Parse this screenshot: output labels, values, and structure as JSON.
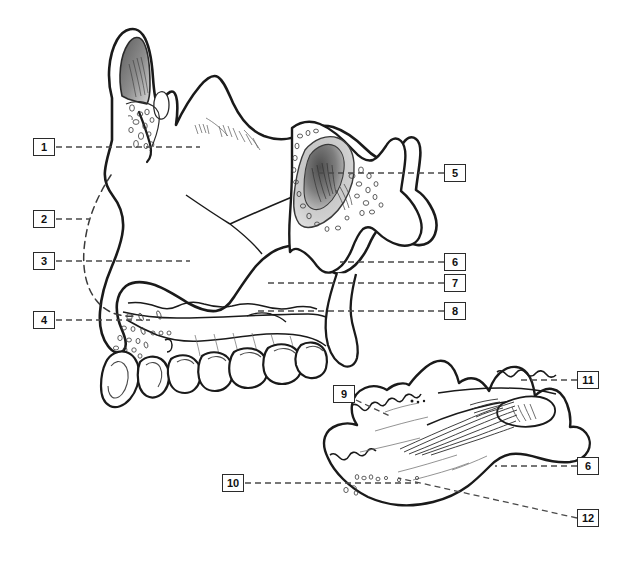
{
  "figure": {
    "type": "anatomical-line-diagram",
    "title_visible": false,
    "background_color": "#ffffff",
    "ink_color": "#1a1a1a",
    "leader_line_color": "#4a4a4a",
    "shading": {
      "frontal_sinus_dark": "#4c4c4c",
      "frontal_sinus_light": "#d6d6d6",
      "sphenoid_sinus_dark": "#5a5a5a",
      "sphenoid_sinus_light": "#cfcfcf"
    },
    "panels": [
      {
        "name": "upper-panel",
        "description": "sagittal medial view of maxilla, palatine and sphenoid region with teeth"
      },
      {
        "name": "lower-panel",
        "description": "isolated bone specimen, oblique inferior view"
      }
    ]
  },
  "labels": [
    {
      "id": "1",
      "text": "1",
      "box_x": 33,
      "box_y": 138,
      "leader_to_x": 200,
      "leader_to_y": 147,
      "panel": "upper-panel",
      "side": "left"
    },
    {
      "id": "2",
      "text": "2",
      "box_x": 33,
      "box_y": 210,
      "leader_to_x": 89,
      "leader_to_y": 219,
      "panel": "upper-panel",
      "side": "left"
    },
    {
      "id": "3",
      "text": "3",
      "box_x": 33,
      "box_y": 252,
      "leader_to_x": 190,
      "leader_to_y": 261,
      "panel": "upper-panel",
      "side": "left"
    },
    {
      "id": "4",
      "text": "4",
      "box_x": 33,
      "box_y": 311,
      "leader_to_x": 150,
      "leader_to_y": 320,
      "panel": "upper-panel",
      "side": "left"
    },
    {
      "id": "5",
      "text": "5",
      "box_x": 444,
      "box_y": 164,
      "leader_to_x": 313,
      "leader_to_y": 173,
      "panel": "upper-panel",
      "side": "right"
    },
    {
      "id": "6",
      "text": "6",
      "box_x": 444,
      "box_y": 253,
      "leader_to_x": 340,
      "leader_to_y": 262,
      "panel": "upper-panel",
      "side": "right"
    },
    {
      "id": "7",
      "text": "7",
      "box_x": 444,
      "box_y": 274,
      "leader_to_x": 266,
      "leader_to_y": 283,
      "panel": "upper-panel",
      "side": "right"
    },
    {
      "id": "8",
      "text": "8",
      "box_x": 444,
      "box_y": 302,
      "leader_to_x": 255,
      "leader_to_y": 311,
      "panel": "upper-panel",
      "side": "right"
    },
    {
      "id": "9",
      "text": "9",
      "box_x": 333,
      "box_y": 385,
      "leader_to_x": 392,
      "leader_to_y": 417,
      "panel": "lower-panel",
      "side": "left"
    },
    {
      "id": "10",
      "text": "10",
      "box_x": 222,
      "box_y": 474,
      "leader_to_x": 418,
      "leader_to_y": 483,
      "panel": "lower-panel",
      "side": "left"
    },
    {
      "id": "11",
      "text": "11",
      "box_x": 577,
      "box_y": 371,
      "leader_to_x": 520,
      "leader_to_y": 380,
      "panel": "lower-panel",
      "side": "right"
    },
    {
      "id": "12",
      "text": "12",
      "box_x": 577,
      "box_y": 509,
      "leader_to_x": 398,
      "leader_to_y": 478,
      "panel": "lower-panel",
      "side": "right"
    },
    {
      "id": "6b",
      "text": "6",
      "box_x": 577,
      "box_y": 457,
      "leader_to_x": 495,
      "leader_to_y": 466,
      "panel": "lower-panel",
      "side": "right"
    }
  ]
}
